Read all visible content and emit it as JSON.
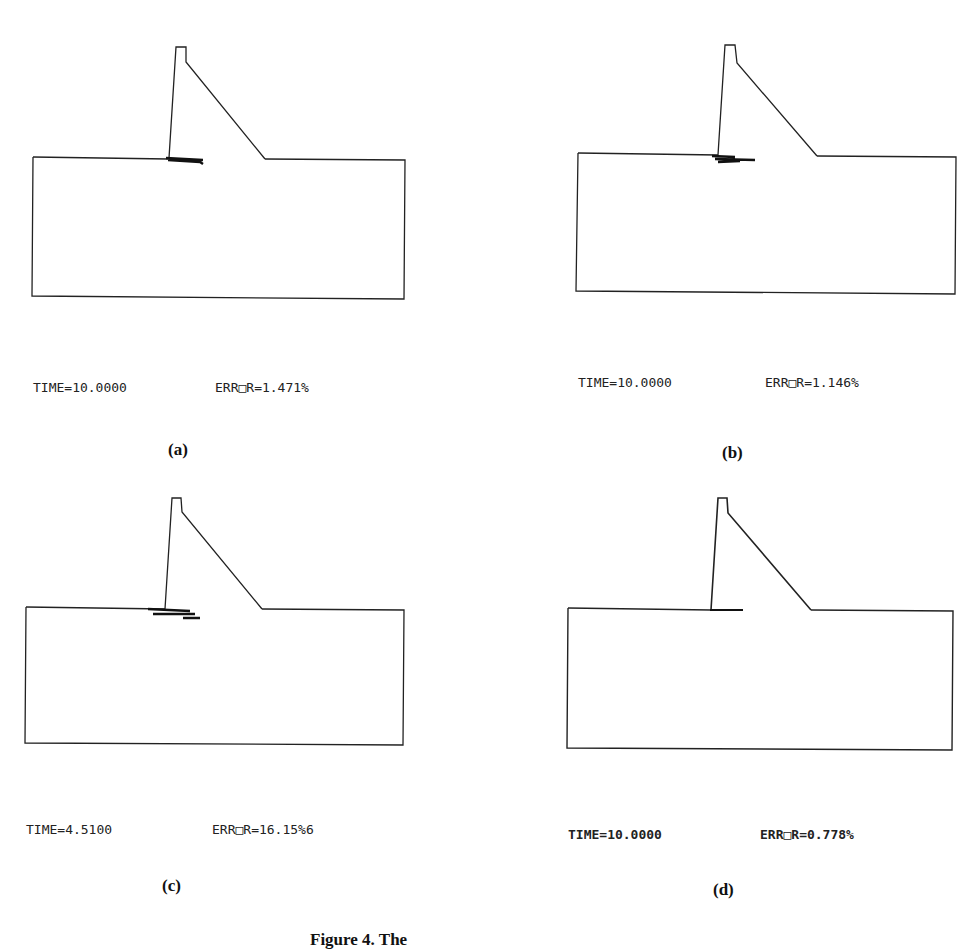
{
  "figure": {
    "caption": "Figure 4. The",
    "panels": [
      {
        "id": "a",
        "label": "(a)",
        "time": "TIME=10.0000",
        "error": "ERR□R=1.471%"
      },
      {
        "id": "b",
        "label": "(b)",
        "time": "TIME=10.0000",
        "error": "ERR□R=1.146%"
      },
      {
        "id": "c",
        "label": "(c)",
        "time": "TIME=4.5100",
        "error": "ERR□R=16.15%6"
      },
      {
        "id": "d",
        "label": "(d)",
        "time": "TIME=10.0000",
        "error": "ERR□R=0.778%"
      }
    ]
  },
  "colors": {
    "line": "#222222",
    "crack": "#111111",
    "background": "#ffffff"
  }
}
